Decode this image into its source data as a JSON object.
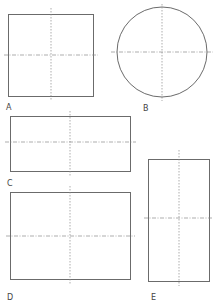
{
  "diagram": {
    "title": "",
    "stroke_color": "#6b6b6b",
    "centerline_color": "#8a8a8a",
    "figures": [
      {
        "id": "A",
        "label": "A",
        "shape": "square",
        "x": 8,
        "y": 14,
        "w": 85,
        "h": 82,
        "cx": 51,
        "cy": 55,
        "label_x": 6,
        "label_y": 110
      },
      {
        "id": "B",
        "label": "B",
        "shape": "circle",
        "cx": 162,
        "cy": 52,
        "r": 45,
        "label_x": 144,
        "label_y": 111
      },
      {
        "id": "C",
        "label": "C",
        "shape": "rectangle-landscape",
        "x": 10,
        "y": 116,
        "w": 120,
        "h": 55,
        "cx": 70,
        "cy": 142,
        "label_x": 7,
        "label_y": 186
      },
      {
        "id": "D",
        "label": "D",
        "shape": "rectangle-landscape-tall",
        "x": 10,
        "y": 192,
        "w": 120,
        "h": 87,
        "cx": 70,
        "cy": 236,
        "label_x": 7,
        "label_y": 300
      },
      {
        "id": "E",
        "label": "E",
        "shape": "rectangle-portrait",
        "x": 148,
        "y": 159,
        "w": 61,
        "h": 122,
        "cx": 179,
        "cy": 218,
        "label_x": 151,
        "label_y": 300
      }
    ]
  }
}
